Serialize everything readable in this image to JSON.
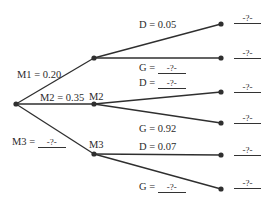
{
  "diagram": {
    "type": "probability-tree",
    "root": {
      "id": "start"
    },
    "level1": [
      {
        "id": "M1",
        "edge_label": "M1 = 0.20",
        "node_label": "",
        "probability": "0.20"
      },
      {
        "id": "M2",
        "edge_label": "M2 = 0.35",
        "node_label": "M2",
        "probability": "0.35"
      },
      {
        "id": "M3",
        "edge_label_prefix": "M3 =",
        "edge_blank": "-?-",
        "node_label": "M3",
        "probability": "-?-"
      }
    ],
    "level2": [
      {
        "parent": "M1",
        "outcome": "D",
        "label_prefix": "D = 0.05",
        "blank": "",
        "result": "-?-"
      },
      {
        "parent": "M1",
        "outcome": "G",
        "label_prefix": "G =",
        "blank": "-?-",
        "result": "-?-"
      },
      {
        "parent": "M2",
        "outcome": "D",
        "label_prefix": "D =",
        "blank": "-?-",
        "result": "-?-"
      },
      {
        "parent": "M2",
        "outcome": "G",
        "label_prefix": "G = 0.92",
        "blank": "",
        "result": "-?-"
      },
      {
        "parent": "M3",
        "outcome": "D",
        "label_prefix": "D = 0.07",
        "blank": "",
        "result": "-?-"
      },
      {
        "parent": "M3",
        "outcome": "G",
        "label_prefix": "G =",
        "blank": "-?-",
        "result": "-?-"
      }
    ],
    "colors": {
      "line": "#2f2f2f",
      "node": "#2f2f2f",
      "text": "#2b2b2b"
    }
  }
}
